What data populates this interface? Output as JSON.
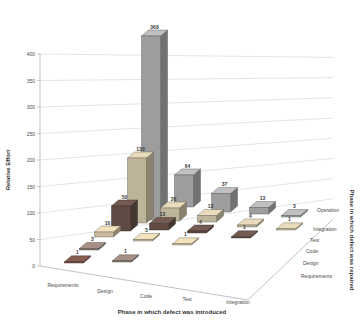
{
  "chart_data": {
    "type": "bar",
    "projection": "3d-column",
    "title": "",
    "xlabel": "Phase in which defect was introduced",
    "ylabel": "Relative Effort",
    "zlabel": "Phase in which defect was repaired",
    "x_categories": [
      "Requirements",
      "Design",
      "Code",
      "Test",
      "Integration"
    ],
    "z_categories": [
      "Requirements",
      "Design",
      "Code",
      "Test",
      "Integration",
      "Operation"
    ],
    "ylim": [
      0,
      400
    ],
    "ytick_step": 50,
    "grid": true,
    "legend": false,
    "data_labels": true,
    "series": [
      {
        "name": "Requirements",
        "color": "#6e4c42",
        "values": [
          1,
          null,
          null,
          null,
          null
        ]
      },
      {
        "name": "Design",
        "color": "#87776d",
        "values": [
          3,
          1,
          null,
          null,
          null
        ]
      },
      {
        "name": "Code",
        "color": "#c6ba9b",
        "values": [
          10,
          3,
          1,
          null,
          null
        ]
      },
      {
        "name": "Test",
        "color": "#5f4b43",
        "values": [
          50,
          13,
          4,
          1,
          null
        ]
      },
      {
        "name": "Integration",
        "color": "#beb49a",
        "values": [
          130,
          26,
          13,
          4,
          1
        ]
      },
      {
        "name": "Operation",
        "color": "#9d9d9d",
        "values": [
          368,
          64,
          37,
          13,
          3
        ]
      }
    ]
  },
  "colors": {
    "background": "#ffffff",
    "grid": "#d9d9d9",
    "axis": "#b0b0b0",
    "tick_text": "#4a4a4a",
    "bar_label_text": "#3a3a3a"
  }
}
